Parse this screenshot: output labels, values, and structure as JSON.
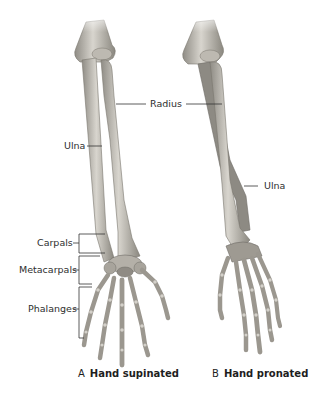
{
  "figure": {
    "panels": [
      {
        "letter": "A",
        "title": "Hand supinated"
      },
      {
        "letter": "B",
        "title": "Hand pronated"
      }
    ],
    "labels": {
      "radius": "Radius",
      "ulna_left": "Ulna",
      "ulna_right": "Ulna",
      "carpals": "Carpals",
      "metacarpals": "Metacarpals",
      "phalanges": "Phalanges"
    },
    "colors": {
      "background": "#ffffff",
      "bone_light": "#d9d6cf",
      "bone_mid": "#aaa69e",
      "bone_dark": "#6f6c66",
      "leader_line": "#333333",
      "text": "#2e2e2e"
    }
  }
}
